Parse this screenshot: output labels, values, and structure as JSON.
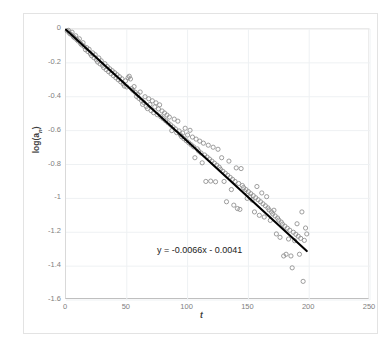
{
  "chart_data": {
    "type": "scatter",
    "title": "",
    "xlabel": "t",
    "ylabel": "log(a_n)",
    "ylabel_base": "log(a",
    "ylabel_sub": "n",
    "ylabel_close": ")",
    "xlim": [
      0,
      250
    ],
    "ylim": [
      -1.6,
      0
    ],
    "xticks": [
      0,
      50,
      100,
      150,
      200,
      250
    ],
    "yticks": [
      0,
      -0.2,
      -0.4,
      -0.6,
      -0.8,
      -1,
      -1.2,
      -1.4,
      -1.6
    ],
    "xtick_labels": [
      "0",
      "50",
      "100",
      "150",
      "200",
      "250"
    ],
    "ytick_labels": [
      "0",
      "-0.2",
      "-0.4",
      "-0.6",
      "-0.8",
      "-1",
      "-1.2",
      "-1.4",
      "-1.6"
    ],
    "grid": true,
    "legend": "none",
    "marker": "open-circle",
    "marker_color": "#8c8c8c",
    "line_color": "#000000",
    "annotations": [
      {
        "text": "y = -0.0066x - 0.0041",
        "x": 100,
        "y": -1.27
      }
    ],
    "trendline": {
      "equation": "y = -0.0066x - 0.0041",
      "slope": -0.0066,
      "intercept": -0.0041,
      "x_start": 0,
      "x_end": 198,
      "y_start": -0.0041,
      "y_end": -1.3109
    },
    "series": [
      {
        "name": "log(a_n) vs t",
        "points": [
          [
            1,
            -0.012
          ],
          [
            2,
            -0.008
          ],
          [
            3,
            -0.026
          ],
          [
            4,
            -0.031
          ],
          [
            5,
            -0.019
          ],
          [
            6,
            -0.045
          ],
          [
            7,
            -0.052
          ],
          [
            8,
            -0.04
          ],
          [
            9,
            -0.063
          ],
          [
            10,
            -0.071
          ],
          [
            11,
            -0.058
          ],
          [
            12,
            -0.086
          ],
          [
            13,
            -0.094
          ],
          [
            14,
            -0.081
          ],
          [
            15,
            -0.104
          ],
          [
            16,
            -0.122
          ],
          [
            17,
            -0.11
          ],
          [
            18,
            -0.133
          ],
          [
            19,
            -0.12
          ],
          [
            20,
            -0.146
          ],
          [
            21,
            -0.158
          ],
          [
            22,
            -0.141
          ],
          [
            23,
            -0.17
          ],
          [
            24,
            -0.152
          ],
          [
            25,
            -0.182
          ],
          [
            26,
            -0.195
          ],
          [
            27,
            -0.171
          ],
          [
            28,
            -0.206
          ],
          [
            29,
            -0.188
          ],
          [
            30,
            -0.215
          ],
          [
            31,
            -0.228
          ],
          [
            32,
            -0.205
          ],
          [
            33,
            -0.24
          ],
          [
            34,
            -0.222
          ],
          [
            35,
            -0.252
          ],
          [
            36,
            -0.235
          ],
          [
            37,
            -0.264
          ],
          [
            38,
            -0.246
          ],
          [
            39,
            -0.276
          ],
          [
            40,
            -0.258
          ],
          [
            41,
            -0.288
          ],
          [
            42,
            -0.27
          ],
          [
            43,
            -0.3
          ],
          [
            44,
            -0.282
          ],
          [
            45,
            -0.312
          ],
          [
            46,
            -0.294
          ],
          [
            47,
            -0.324
          ],
          [
            48,
            -0.337
          ],
          [
            49,
            -0.306
          ],
          [
            50,
            -0.342
          ],
          [
            51,
            -0.288
          ],
          [
            52,
            -0.279
          ],
          [
            53,
            -0.295
          ],
          [
            54,
            -0.352
          ],
          [
            55,
            -0.362
          ],
          [
            56,
            -0.34
          ],
          [
            57,
            -0.374
          ],
          [
            58,
            -0.398
          ],
          [
            59,
            -0.386
          ],
          [
            60,
            -0.41
          ],
          [
            61,
            -0.372
          ],
          [
            62,
            -0.422
          ],
          [
            63,
            -0.445
          ],
          [
            64,
            -0.434
          ],
          [
            65,
            -0.4
          ],
          [
            66,
            -0.458
          ],
          [
            67,
            -0.47
          ],
          [
            68,
            -0.412
          ],
          [
            69,
            -0.446
          ],
          [
            70,
            -0.482
          ],
          [
            71,
            -0.424
          ],
          [
            72,
            -0.494
          ],
          [
            73,
            -0.46
          ],
          [
            74,
            -0.436
          ],
          [
            75,
            -0.506
          ],
          [
            76,
            -0.472
          ],
          [
            77,
            -0.448
          ],
          [
            78,
            -0.518
          ],
          [
            79,
            -0.484
          ],
          [
            80,
            -0.53
          ],
          [
            81,
            -0.496
          ],
          [
            82,
            -0.542
          ],
          [
            83,
            -0.508
          ],
          [
            84,
            -0.554
          ],
          [
            85,
            -0.52
          ],
          [
            86,
            -0.566
          ],
          [
            87,
            -0.6
          ],
          [
            88,
            -0.578
          ],
          [
            89,
            -0.532
          ],
          [
            90,
            -0.59
          ],
          [
            91,
            -0.612
          ],
          [
            92,
            -0.544
          ],
          [
            93,
            -0.602
          ],
          [
            94,
            -0.624
          ],
          [
            95,
            -0.636
          ],
          [
            96,
            -0.614
          ],
          [
            97,
            -0.648
          ],
          [
            98,
            -0.586
          ],
          [
            99,
            -0.66
          ],
          [
            100,
            -0.626
          ],
          [
            101,
            -0.672
          ],
          [
            102,
            -0.598
          ],
          [
            103,
            -0.684
          ],
          [
            104,
            -0.638
          ],
          [
            105,
            -0.696
          ],
          [
            106,
            -0.76
          ],
          [
            107,
            -0.65
          ],
          [
            108,
            -0.708
          ],
          [
            109,
            -0.72
          ],
          [
            110,
            -0.662
          ],
          [
            111,
            -0.732
          ],
          [
            112,
            -0.79
          ],
          [
            113,
            -0.674
          ],
          [
            114,
            -0.744
          ],
          [
            115,
            -0.9
          ],
          [
            116,
            -0.756
          ],
          [
            117,
            -0.686
          ],
          [
            118,
            -0.768
          ],
          [
            119,
            -0.898
          ],
          [
            120,
            -0.78
          ],
          [
            121,
            -0.698
          ],
          [
            122,
            -0.792
          ],
          [
            123,
            -0.902
          ],
          [
            124,
            -0.804
          ],
          [
            125,
            -0.71
          ],
          [
            126,
            -0.816
          ],
          [
            127,
            -0.828
          ],
          [
            128,
            -0.76
          ],
          [
            129,
            -0.84
          ],
          [
            130,
            -0.9
          ],
          [
            131,
            -0.852
          ],
          [
            132,
            -1.02
          ],
          [
            133,
            -0.864
          ],
          [
            134,
            -0.78
          ],
          [
            135,
            -0.876
          ],
          [
            136,
            -0.948
          ],
          [
            137,
            -0.888
          ],
          [
            138,
            -1.04
          ],
          [
            139,
            -0.9
          ],
          [
            140,
            -0.82
          ],
          [
            141,
            -1.06
          ],
          [
            142,
            -0.912
          ],
          [
            143,
            -1.065
          ],
          [
            144,
            -0.824
          ],
          [
            145,
            -0.924
          ],
          [
            146,
            -0.936
          ],
          [
            147,
            -0.96
          ],
          [
            148,
            -0.948
          ],
          [
            149,
            -1.0
          ],
          [
            150,
            -0.96
          ],
          [
            151,
            -0.99
          ],
          [
            152,
            -0.972
          ],
          [
            153,
            -1.01
          ],
          [
            154,
            -0.984
          ],
          [
            155,
            -1.08
          ],
          [
            156,
            -0.996
          ],
          [
            157,
            -0.93
          ],
          [
            158,
            -1.008
          ],
          [
            159,
            -1.1
          ],
          [
            160,
            -1.02
          ],
          [
            161,
            -0.968
          ],
          [
            162,
            -1.032
          ],
          [
            163,
            -1.11
          ],
          [
            164,
            -1.044
          ],
          [
            165,
            -0.99
          ],
          [
            166,
            -1.056
          ],
          [
            167,
            -1.068
          ],
          [
            168,
            -1.13
          ],
          [
            169,
            -1.08
          ],
          [
            170,
            -1.092
          ],
          [
            171,
            -1.07
          ],
          [
            172,
            -1.104
          ],
          [
            173,
            -1.21
          ],
          [
            174,
            -1.116
          ],
          [
            175,
            -1.128
          ],
          [
            176,
            -1.23
          ],
          [
            177,
            -1.14
          ],
          [
            178,
            -1.152
          ],
          [
            179,
            -1.34
          ],
          [
            180,
            -1.164
          ],
          [
            181,
            -1.33
          ],
          [
            182,
            -1.176
          ],
          [
            183,
            -1.24
          ],
          [
            184,
            -1.188
          ],
          [
            185,
            -1.34
          ],
          [
            186,
            -1.41
          ],
          [
            187,
            -1.2
          ],
          [
            188,
            -1.25
          ],
          [
            189,
            -1.212
          ],
          [
            190,
            -1.15
          ],
          [
            191,
            -1.224
          ],
          [
            192,
            -1.33
          ],
          [
            193,
            -1.236
          ],
          [
            194,
            -1.08
          ],
          [
            195,
            -1.49
          ],
          [
            196,
            -1.248
          ],
          [
            197,
            -1.175
          ],
          [
            198,
            -1.21
          ]
        ]
      }
    ]
  }
}
